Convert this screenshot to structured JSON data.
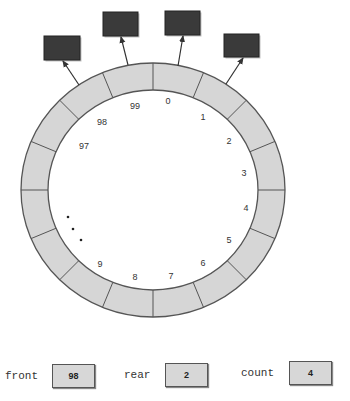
{
  "diagram": {
    "ring": {
      "visible_segments": 16,
      "fill": "#d6d6d6",
      "stroke": "#555555"
    },
    "index_labels": [
      {
        "text": "0",
        "x": 168,
        "y": 104
      },
      {
        "text": "1",
        "x": 203,
        "y": 120
      },
      {
        "text": "2",
        "x": 229,
        "y": 144
      },
      {
        "text": "3",
        "x": 244,
        "y": 176
      },
      {
        "text": "4",
        "x": 246,
        "y": 211
      },
      {
        "text": "5",
        "x": 229,
        "y": 243
      },
      {
        "text": "6",
        "x": 203,
        "y": 266
      },
      {
        "text": "7",
        "x": 171,
        "y": 279
      },
      {
        "text": "8",
        "x": 135,
        "y": 280
      },
      {
        "text": "9",
        "x": 100,
        "y": 267
      },
      {
        "text": "97",
        "x": 84,
        "y": 149
      },
      {
        "text": "98",
        "x": 102,
        "y": 125
      },
      {
        "text": "99",
        "x": 135,
        "y": 109
      }
    ],
    "ellipsis_dots": [
      {
        "x": 68,
        "y": 217
      },
      {
        "x": 73,
        "y": 229
      },
      {
        "x": 81,
        "y": 240
      }
    ],
    "elements": [
      {
        "name": "element-at-98",
        "box": {
          "x": 44,
          "y": 36,
          "w": 36,
          "h": 24
        },
        "arrow": {
          "x1": 79,
          "y1": 85,
          "x2": 63,
          "y2": 61
        }
      },
      {
        "name": "element-at-99",
        "box": {
          "x": 103,
          "y": 12,
          "w": 35,
          "h": 24
        },
        "arrow": {
          "x1": 128,
          "y1": 65,
          "x2": 121,
          "y2": 37
        }
      },
      {
        "name": "element-at-0",
        "box": {
          "x": 165,
          "y": 11,
          "w": 35,
          "h": 24
        },
        "arrow": {
          "x1": 178,
          "y1": 66,
          "x2": 183,
          "y2": 36
        }
      },
      {
        "name": "element-at-1",
        "box": {
          "x": 224,
          "y": 34,
          "w": 35,
          "h": 23
        },
        "arrow": {
          "x1": 226,
          "y1": 84,
          "x2": 243,
          "y2": 58
        }
      }
    ],
    "element_color": "#3a3a3a"
  },
  "variables": {
    "front": {
      "label": "front",
      "value": "98"
    },
    "rear": {
      "label": "rear",
      "value": "2"
    },
    "count": {
      "label": "count",
      "value": "4"
    }
  }
}
